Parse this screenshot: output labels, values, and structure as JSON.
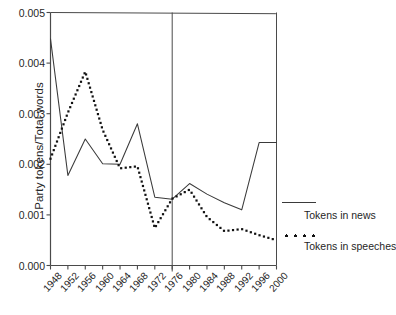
{
  "chart_data": {
    "type": "line",
    "title": "",
    "xlabel": "",
    "ylabel": "Party tokens/Total words",
    "xlim": [
      1948,
      2000
    ],
    "ylim": [
      0.0,
      0.005
    ],
    "yticks": [
      "0.000",
      "0.001",
      "0.002",
      "0.003",
      "0.004",
      "0.005"
    ],
    "ytick_values": [
      0.0,
      0.001,
      0.002,
      0.003,
      0.004,
      0.005
    ],
    "x": [
      1948,
      1952,
      1956,
      1960,
      1964,
      1968,
      1972,
      1976,
      1980,
      1984,
      1988,
      1992,
      1996,
      2000
    ],
    "xticks": [
      "1948",
      "1952",
      "1956",
      "1960",
      "1964",
      "1968",
      "1972",
      "1976",
      "1980",
      "1984",
      "1988",
      "1992",
      "1996",
      "2000"
    ],
    "grid": false,
    "legend_position": "right-outside",
    "annotations": [
      {
        "name": "divider-line",
        "type": "vertical-line",
        "x": 1976,
        "note": "full-height vertical rule inside plot"
      }
    ],
    "series": [
      {
        "name": "Tokens in news",
        "style": "solid",
        "color": "#3a3a3a",
        "values": [
          0.00448,
          0.00178,
          0.0025,
          0.00201,
          0.002,
          0.0028,
          0.00135,
          0.00131,
          0.00162,
          0.00141,
          0.00124,
          0.0011,
          0.00243,
          0.00243
        ]
      },
      {
        "name": "Tokens in speeches",
        "style": "dotted",
        "color": "#111111",
        "values": [
          0.00211,
          0.00302,
          0.00383,
          0.00268,
          0.00192,
          0.00196,
          0.00074,
          0.00132,
          0.0015,
          0.00096,
          0.00068,
          0.00072,
          0.0006,
          0.0005
        ]
      }
    ]
  },
  "legend": {
    "entries": [
      {
        "label": "Tokens in news",
        "marker": "solid-line-swatch"
      },
      {
        "label": "Tokens in speeches",
        "marker": "dotted-line-swatch"
      }
    ]
  },
  "axes": {
    "y_title": "Party tokens/Total words"
  }
}
